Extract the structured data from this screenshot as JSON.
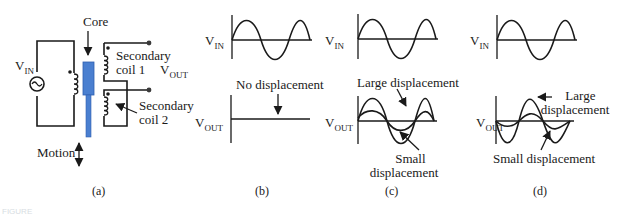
{
  "figure": {
    "panels": [
      {
        "id": "a",
        "caption": "(a)",
        "labels": {
          "core": "Core",
          "vin_main": "V",
          "vin_sub": "IN",
          "secondary_coil_1_line1": "Secondary",
          "secondary_coil_1_line2": "coil 1",
          "secondary_coil_2_line1": "Secondary",
          "secondary_coil_2_line2": "coil 2",
          "vout_main": "V",
          "vout_sub": "OUT",
          "motion": "Motion"
        },
        "colors": {
          "core": "#4a7fd0",
          "core_stroke": "#2f5fb0"
        }
      },
      {
        "id": "b",
        "caption": "(b)",
        "labels": {
          "vin_main": "V",
          "vin_sub": "IN",
          "vout_main": "V",
          "vout_sub": "OUT",
          "annotation": "No displacement"
        }
      },
      {
        "id": "c",
        "caption": "(c)",
        "labels": {
          "vin_main": "V",
          "vin_sub": "IN",
          "vout_main": "V",
          "vout_sub": "OUT",
          "large": "Large displacement",
          "small_line1": "Small",
          "small_line2": "displacement"
        }
      },
      {
        "id": "d",
        "caption": "(d)",
        "labels": {
          "vin_main": "V",
          "vin_sub": "IN",
          "vout_main": "V",
          "vout_sub": "OUT",
          "large_line1": "Large",
          "large_line2": "displacement",
          "small": "Small displacement"
        }
      }
    ],
    "footer_label": "FIGURE"
  }
}
